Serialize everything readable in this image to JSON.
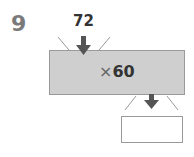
{
  "problem": {
    "number": "9",
    "input_value": "72",
    "operation_symbol": "×",
    "operation_value": "60",
    "answer_value": ""
  },
  "colors": {
    "machine_fill": "#cfcfcf",
    "arrow": "#555555",
    "number_label": "#7a7a7a"
  }
}
